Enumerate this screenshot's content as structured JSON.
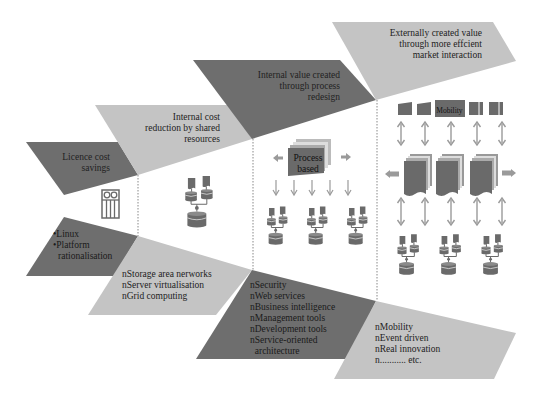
{
  "colors": {
    "dark_band": "#6e6e6e",
    "light_band": "#c4c4c4",
    "icon_fill": "#6a6a6a",
    "arrow": "#9a9a9a",
    "divider": "#888888",
    "text": "#222222"
  },
  "stages": [
    {
      "id": "licence",
      "title_lines": [
        "Licence cost",
        "savings"
      ],
      "items": [
        "Linux",
        "Platform",
        "rationalisation"
      ],
      "item_markers": [
        "•",
        "•",
        ""
      ],
      "icon": "server-rack-icon"
    },
    {
      "id": "shared",
      "title_lines": [
        "Internal cost",
        "reduction by shared",
        "resources"
      ],
      "items": [
        "nStorage area nerworks",
        "nServer virtualisation",
        "nGrid computing"
      ],
      "icon": "shared-database-cluster-icon"
    },
    {
      "id": "process",
      "title_lines": [
        "Internal value created",
        "through process",
        "redesign"
      ],
      "items": [
        "nSecurity",
        "nWeb services",
        "nBusiness intelligence",
        "nManagement tools",
        "nDevelopment tools",
        "nService-oriented",
        "  architecture"
      ],
      "process_box_lines": [
        "Process",
        "based"
      ],
      "icon": "process-stack-icon"
    },
    {
      "id": "external",
      "title_lines": [
        "Externally created value",
        "through more effcient",
        "market interaction"
      ],
      "items": [
        "nMobility",
        "nEvent driven",
        "nReal innovation",
        "n........... etc."
      ],
      "channel_label": "Mobility",
      "icon": "market-channels-icon"
    }
  ]
}
